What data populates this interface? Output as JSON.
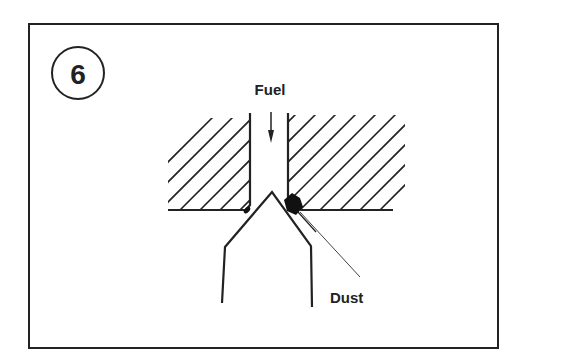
{
  "figure": {
    "step_number": "6",
    "labels": {
      "fuel": "Fuel",
      "dust": "Dust"
    },
    "colors": {
      "line": "#222222",
      "background": "#ffffff",
      "dust_fill": "#111111"
    }
  }
}
